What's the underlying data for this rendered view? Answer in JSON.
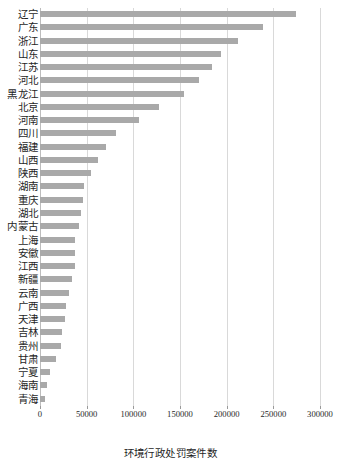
{
  "chart_data": {
    "type": "bar",
    "orientation": "horizontal",
    "title": "",
    "xlabel": "环境行政处罚案件数",
    "ylabel": "",
    "xlim": [
      0,
      300000
    ],
    "xticks": [
      0,
      50000,
      100000,
      150000,
      200000,
      250000,
      300000
    ],
    "xticklabels": [
      "0",
      "50000",
      "100000",
      "150000",
      "200000",
      "250000",
      "300000"
    ],
    "grid": "vertical",
    "legend": "none",
    "bar_color": "#a9a9a9",
    "categories": [
      "辽宁",
      "广东",
      "浙江",
      "山东",
      "江苏",
      "河北",
      "黑龙江",
      "北京",
      "河南",
      "四川",
      "福建",
      "山西",
      "陕西",
      "湖南",
      "重庆",
      "湖北",
      "内蒙古",
      "上海",
      "安徽",
      "江西",
      "新疆",
      "云南",
      "广西",
      "天津",
      "吉林",
      "贵州",
      "甘肃",
      "宁夏",
      "海南",
      "青海"
    ],
    "values": [
      274000,
      239000,
      212000,
      194000,
      184000,
      170000,
      154000,
      128000,
      106000,
      81000,
      71000,
      62000,
      55000,
      47000,
      46000,
      44000,
      42000,
      38000,
      37500,
      37000,
      34000,
      31000,
      28000,
      27000,
      24000,
      22500,
      17500,
      11000,
      7500,
      5000
    ]
  }
}
